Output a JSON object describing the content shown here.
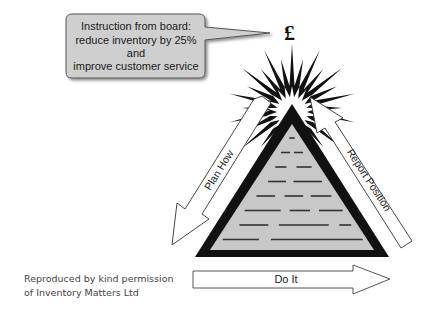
{
  "bubble": {
    "lines": [
      "Instruction from board:",
      "reduce inventory by 25%",
      "and",
      "improve customer service"
    ],
    "fill": "#cfcfcf"
  },
  "symbol": {
    "currency": "£"
  },
  "arrows": {
    "plan": "Plan How",
    "report": "Report Position",
    "do": "Do It"
  },
  "pyramid": {
    "fill": "#c8c8c8",
    "outline": "#111111"
  },
  "credit": {
    "line1": "Reproduced by kind permission",
    "line2": "of Inventory Matters Ltd"
  }
}
